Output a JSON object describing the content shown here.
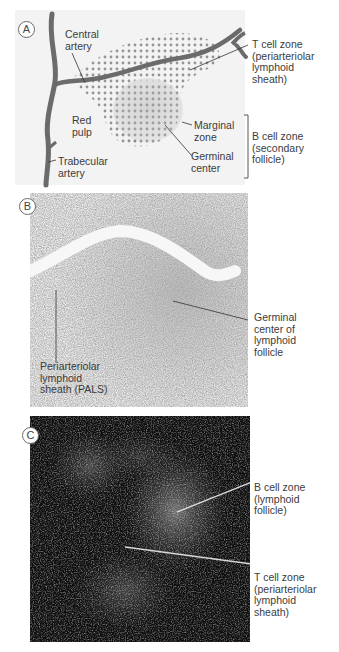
{
  "figure": {
    "panels": [
      {
        "letter": "A",
        "type": "schematic",
        "labels": {
          "central_artery": "Central\nartery",
          "t_cell_zone": "T cell zone\n(periarteriolar\nlymphoid\nsheath)",
          "red_pulp": "Red\npulp",
          "marginal_zone": "Marginal\nzone",
          "germinal_center": "Germinal\ncenter",
          "b_cell_zone": "B cell zone\n(secondary\nfollicle)",
          "trabecular_artery": "Trabecular\nartery"
        }
      },
      {
        "letter": "B",
        "type": "micrograph",
        "labels": {
          "germinal_center": "Germinal\ncenter of\nlymphoid\nfollicle",
          "pals": "Periarteriolar\nlymphoid\nsheath (PALS)"
        }
      },
      {
        "letter": "C",
        "type": "fluorescence-micrograph",
        "labels": {
          "b_cell_zone": "B cell zone\n(lymphoid\nfollicle)",
          "t_cell_zone": "T cell zone\n(periarteriolar\nlymphoid\nsheath)"
        }
      }
    ],
    "colors": {
      "artery": "#6b6b6b",
      "dots": "#8a8a8a",
      "germinal_fill": "#c8c8c8",
      "panel_a_bg": "#f2f2f2",
      "panel_c_bg": "#0e0e0e"
    }
  }
}
